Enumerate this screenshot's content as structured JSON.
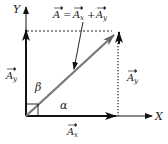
{
  "diagram": {
    "axes": {
      "x_label": "X",
      "y_label": "Y"
    },
    "formula": {
      "lhs": "A",
      "eq": "=",
      "term1": "A",
      "term1_sub": "x",
      "plus": "+",
      "term2": "A",
      "term2_sub": "y"
    },
    "labels": {
      "ay_left": {
        "base": "A",
        "sub": "y"
      },
      "ay_right": {
        "base": "A",
        "sub": "y"
      },
      "ax": {
        "base": "A",
        "sub": "x"
      },
      "alpha": "α",
      "beta": "β"
    },
    "colors": {
      "axis": "#111111",
      "resultant": "#777777",
      "text": "#222222",
      "dashed": "#222222"
    }
  }
}
